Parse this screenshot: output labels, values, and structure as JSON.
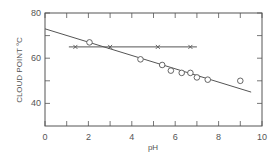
{
  "chart_data": {
    "type": "scatter",
    "title": "",
    "xlabel": "pH",
    "ylabel": "CLOUD POINT °C",
    "xlim": [
      0,
      10
    ],
    "ylim": [
      30,
      80
    ],
    "x_ticks": [
      0,
      2,
      4,
      6,
      8,
      10
    ],
    "x_tick_labels": [
      "0",
      "2",
      "4",
      "6",
      "8",
      "10"
    ],
    "x_minor_ticks": [
      1,
      3,
      5,
      7,
      9
    ],
    "y_ticks": [
      40,
      60,
      80
    ],
    "y_tick_labels": [
      "40",
      "60",
      "80"
    ],
    "y_minor_ticks": [
      50,
      70
    ],
    "grid": false,
    "legend": null,
    "series": [
      {
        "name": "circles",
        "marker": "open-circle",
        "x": [
          2.05,
          4.4,
          5.4,
          5.8,
          6.3,
          6.7,
          7.0,
          7.5,
          9.0
        ],
        "y": [
          67,
          59.5,
          57,
          54.5,
          53.5,
          53.5,
          51.5,
          50.5,
          50
        ]
      },
      {
        "name": "crosses",
        "marker": "x",
        "x": [
          1.4,
          3.0,
          5.2,
          6.7
        ],
        "y": [
          65,
          65,
          65,
          65
        ]
      }
    ],
    "lines": [
      {
        "name": "circles-fit",
        "x": [
          0,
          9.5
        ],
        "y": [
          73,
          45
        ]
      },
      {
        "name": "crosses-fit",
        "x": [
          1.1,
          7.0
        ],
        "y": [
          65,
          65
        ]
      }
    ]
  }
}
